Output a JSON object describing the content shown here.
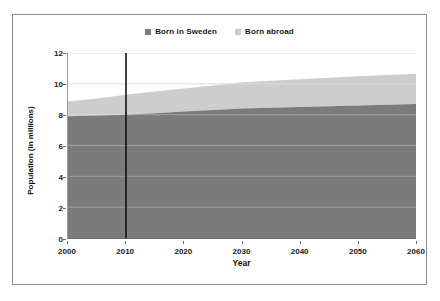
{
  "chart_data": {
    "type": "area",
    "title": "",
    "subtitle": "",
    "xlabel": "Year",
    "ylabel": "Population (in millions)",
    "xlim": [
      2000,
      2060
    ],
    "ylim": [
      0,
      12
    ],
    "xticks": [
      "2000",
      "2010",
      "2020",
      "2030",
      "2040",
      "2050",
      "2060"
    ],
    "yticks": [
      "0",
      "2",
      "4",
      "6",
      "8",
      "10",
      "12"
    ],
    "grid": true,
    "stacked": true,
    "legend_position": "top-center",
    "x": [
      2000,
      2005,
      2010,
      2015,
      2020,
      2025,
      2030,
      2035,
      2040,
      2045,
      2050,
      2055,
      2060
    ],
    "series": [
      {
        "name": "Born in Sweden",
        "color": "#7b7b7b",
        "values": [
          7.9,
          7.95,
          8.0,
          8.1,
          8.2,
          8.3,
          8.4,
          8.45,
          8.5,
          8.55,
          8.6,
          8.65,
          8.7
        ]
      },
      {
        "name": "Born abroad",
        "color": "#cdcdcd",
        "values": [
          0.95,
          1.1,
          1.3,
          1.4,
          1.5,
          1.6,
          1.7,
          1.75,
          1.8,
          1.85,
          1.9,
          1.92,
          1.95
        ]
      }
    ],
    "totals": [
      8.85,
      9.05,
      9.3,
      9.5,
      9.7,
      9.9,
      10.1,
      10.2,
      10.3,
      10.4,
      10.5,
      10.57,
      10.65
    ],
    "annotations": [
      {
        "name": "reference-line",
        "type": "vline",
        "x": 2010,
        "color": "#111111",
        "label": ""
      }
    ]
  },
  "legend": {
    "items": [
      {
        "label": "Born in Sweden",
        "color": "#7b7b7b"
      },
      {
        "label": "Born abroad",
        "color": "#cdcdcd"
      }
    ]
  },
  "axes": {
    "x_title": "Year",
    "y_title": "Population (in millions)"
  }
}
